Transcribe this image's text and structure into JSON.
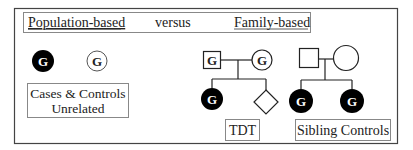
{
  "header": {
    "left_label": "Population-based",
    "middle_label": "versus",
    "right_label": "Family-based"
  },
  "population_based": {
    "case_symbol": {
      "shape": "circle",
      "filled": true,
      "label": "G"
    },
    "control_symbol": {
      "shape": "circle",
      "filled": false,
      "label": "G"
    },
    "caption_line1": "Cases & Controls",
    "caption_line2": "Unrelated"
  },
  "tdt": {
    "father": {
      "shape": "square",
      "filled": false,
      "label": "G"
    },
    "mother": {
      "shape": "circle",
      "filled": false,
      "label": "G"
    },
    "affected_child": {
      "shape": "circle",
      "filled": true,
      "label": "G"
    },
    "sibling": {
      "shape": "diamond",
      "filled": false,
      "label": ""
    },
    "caption": "TDT"
  },
  "sibling_controls": {
    "father": {
      "shape": "square",
      "filled": false,
      "label": ""
    },
    "mother": {
      "shape": "circle",
      "filled": false,
      "label": ""
    },
    "child1": {
      "shape": "circle",
      "filled": true,
      "label": "G"
    },
    "child2": {
      "shape": "circle",
      "filled": true,
      "label": "G"
    },
    "caption": "Sibling Controls"
  },
  "colors": {
    "line": "#222222",
    "fill_dark": "#000000",
    "box_border": "#888888",
    "background": "#ffffff"
  }
}
